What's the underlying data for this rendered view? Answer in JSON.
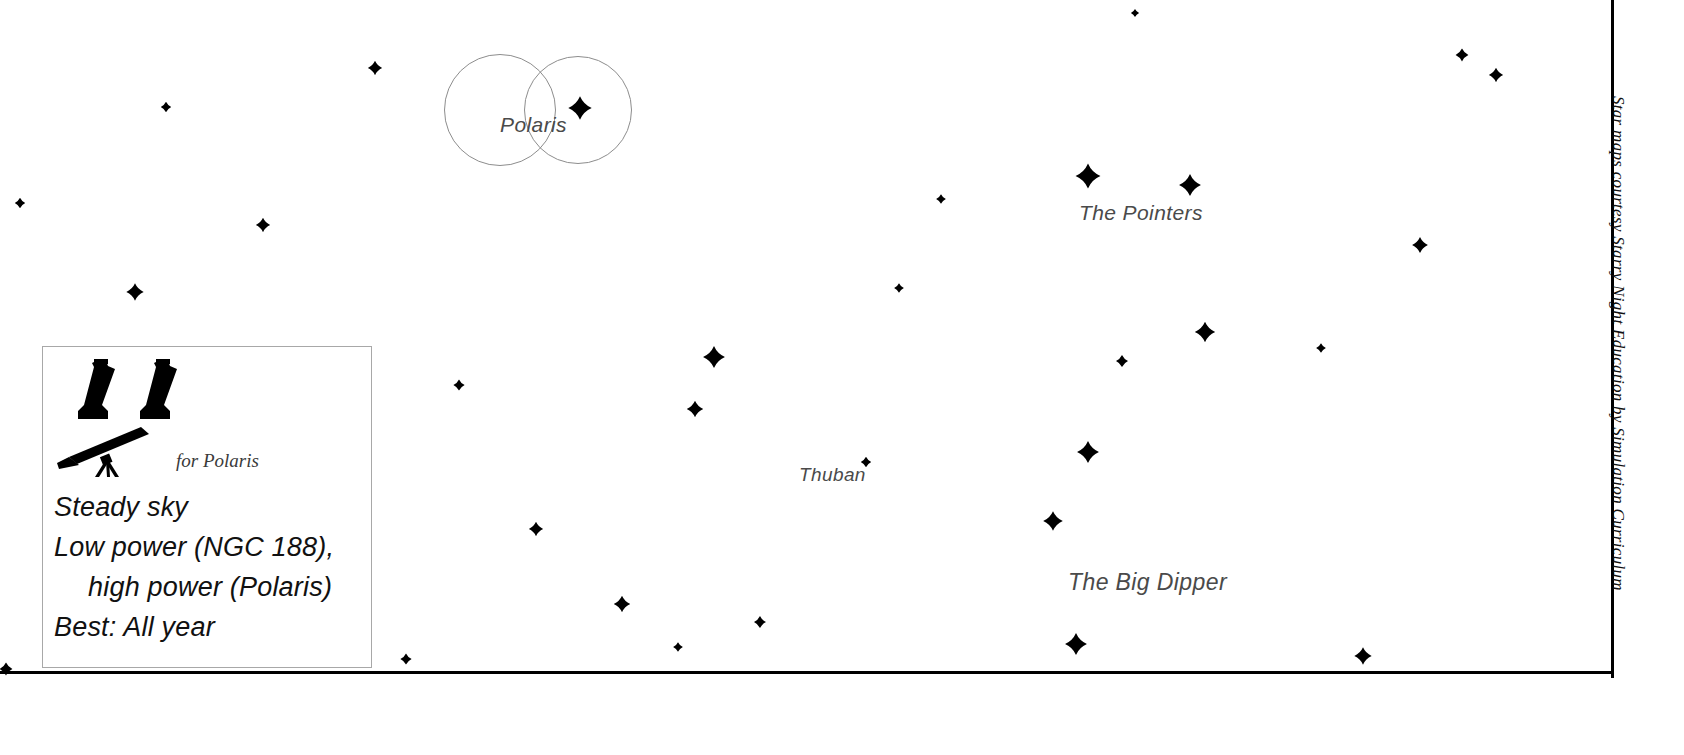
{
  "chart_data": {
    "type": "scatter",
    "title": "",
    "xlabel": "",
    "ylabel": "",
    "xlim": [
      0,
      1684
    ],
    "ylim": [
      0,
      755
    ],
    "grid": false,
    "legend": "none",
    "stars": [
      {
        "x": 1135,
        "y": 13,
        "mag": 1.0
      },
      {
        "x": 375,
        "y": 68,
        "mag": 2.6
      },
      {
        "x": 1462,
        "y": 55,
        "mag": 2.2
      },
      {
        "x": 1496,
        "y": 75,
        "mag": 2.6
      },
      {
        "x": 166,
        "y": 107,
        "mag": 1.6
      },
      {
        "x": 580,
        "y": 108,
        "mag": 5.0,
        "name": "Polaris"
      },
      {
        "x": 1088,
        "y": 176,
        "mag": 5.4
      },
      {
        "x": 1190,
        "y": 185,
        "mag": 4.6
      },
      {
        "x": 20,
        "y": 203,
        "mag": 1.6
      },
      {
        "x": 941,
        "y": 199,
        "mag": 1.4
      },
      {
        "x": 263,
        "y": 225,
        "mag": 2.6
      },
      {
        "x": 1420,
        "y": 245,
        "mag": 3.0
      },
      {
        "x": 135,
        "y": 292,
        "mag": 3.4
      },
      {
        "x": 899,
        "y": 288,
        "mag": 1.4
      },
      {
        "x": 1205,
        "y": 332,
        "mag": 4.2
      },
      {
        "x": 1321,
        "y": 348,
        "mag": 1.4
      },
      {
        "x": 714,
        "y": 357,
        "mag": 4.6
      },
      {
        "x": 1122,
        "y": 361,
        "mag": 2.0
      },
      {
        "x": 459,
        "y": 385,
        "mag": 1.8
      },
      {
        "x": 695,
        "y": 409,
        "mag": 3.2
      },
      {
        "x": 1088,
        "y": 452,
        "mag": 4.6
      },
      {
        "x": 866,
        "y": 462,
        "mag": 1.6,
        "name": "Thuban"
      },
      {
        "x": 1053,
        "y": 521,
        "mag": 4.0
      },
      {
        "x": 536,
        "y": 529,
        "mag": 2.6
      },
      {
        "x": 622,
        "y": 604,
        "mag": 3.2
      },
      {
        "x": 760,
        "y": 622,
        "mag": 2.0
      },
      {
        "x": 1076,
        "y": 644,
        "mag": 4.6
      },
      {
        "x": 1363,
        "y": 656,
        "mag": 3.4
      },
      {
        "x": 678,
        "y": 647,
        "mag": 1.4
      },
      {
        "x": 406,
        "y": 659,
        "mag": 1.8
      },
      {
        "x": 6,
        "y": 669,
        "mag": 2.2
      }
    ],
    "finder_circles": [
      {
        "cx": 500,
        "cy": 110,
        "r": 56
      },
      {
        "cx": 578,
        "cy": 110,
        "r": 54
      }
    ]
  },
  "sky_labels": {
    "polaris": "Polaris",
    "pointers": "The Pointers",
    "thuban": "Thuban",
    "big_dipper": "The Big Dipper"
  },
  "legend": {
    "binoculars_icon": "binoculars-icon",
    "telescope_icon": "telescope-icon",
    "telescope_note": "for Polaris",
    "lines": [
      "Steady sky",
      "Low power (NGC 188),",
      "high power (Polaris)",
      "Best: All year"
    ]
  },
  "credit": {
    "text": "Star maps courtesy Starry Night Education by Simulation Curriculum"
  },
  "colors": {
    "background": "#ffffff",
    "star": "#000000",
    "label": "#4a4a4a",
    "frame": "#000000",
    "legend_border": "#a8a8a8",
    "circle_stroke": "#8d8d8d"
  }
}
